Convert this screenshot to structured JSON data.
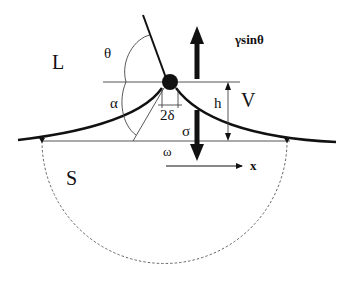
{
  "diagram": {
    "regions": {
      "liquid": "L",
      "vapor": "V",
      "solid": "S"
    },
    "angles": {
      "theta": "θ",
      "alpha": "α"
    },
    "labels": {
      "force_up": "γsinθ",
      "height": "h",
      "width": "2δ",
      "stress": "σ",
      "omega": "ω",
      "x_axis": "x"
    },
    "colors": {
      "stroke": "#111111",
      "thin": "#444444",
      "background": "#ffffff"
    }
  }
}
